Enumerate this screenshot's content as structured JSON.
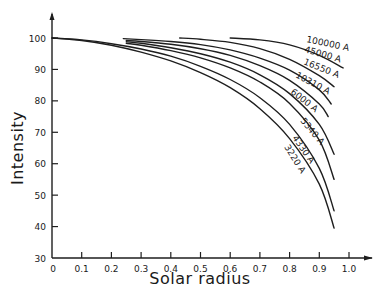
{
  "chart_data": {
    "type": "line",
    "title": "",
    "xlabel": "Solar radius",
    "ylabel": "Intensity",
    "xlim": [
      0,
      1.0
    ],
    "ylim": [
      30,
      100
    ],
    "grid": false,
    "legend": "inline labels at curve ends",
    "x_ticks": [
      "0",
      "0.1",
      "0.2",
      "0.3",
      "0.4",
      "0.5",
      "0.6",
      "0.7",
      "0.8",
      "0.9",
      "1.0"
    ],
    "y_ticks": [
      "30",
      "40",
      "50",
      "60",
      "70",
      "80",
      "90",
      "100"
    ],
    "series": [
      {
        "name": "100000 A",
        "x": [
          0.6,
          0.7,
          0.8,
          0.9,
          0.98
        ],
        "y": [
          100,
          99.4,
          97.8,
          94.5,
          90.5
        ]
      },
      {
        "name": "45000 A",
        "x": [
          0.43,
          0.5,
          0.6,
          0.7,
          0.8,
          0.9,
          0.95
        ],
        "y": [
          100,
          99.6,
          98.6,
          96.6,
          93.2,
          88,
          84.5
        ]
      },
      {
        "name": "16550 A",
        "x": [
          0.24,
          0.3,
          0.4,
          0.5,
          0.6,
          0.7,
          0.8,
          0.9,
          0.94
        ],
        "y": [
          99.8,
          99.5,
          98.9,
          97.9,
          96.2,
          93.6,
          89.8,
          83.5,
          79
        ]
      },
      {
        "name": "10310 A",
        "x": [
          0.25,
          0.3,
          0.4,
          0.5,
          0.6,
          0.7,
          0.8,
          0.9,
          0.93
        ],
        "y": [
          99.2,
          98.9,
          98.0,
          96.6,
          94.5,
          91.2,
          86.5,
          79,
          75
        ]
      },
      {
        "name": "6000 A",
        "x": [
          0.25,
          0.3,
          0.4,
          0.5,
          0.6,
          0.7,
          0.8,
          0.9,
          0.95
        ],
        "y": [
          98.8,
          98.3,
          96.9,
          95.0,
          92.3,
          88.3,
          82.3,
          72.5,
          63
        ]
      },
      {
        "name": "5340 A",
        "x": [
          0.25,
          0.3,
          0.4,
          0.5,
          0.6,
          0.7,
          0.8,
          0.9,
          0.95
        ],
        "y": [
          98.3,
          97.7,
          96.0,
          93.7,
          90.5,
          86.0,
          79.2,
          67.5,
          55
        ]
      },
      {
        "name": "4330 A",
        "x": [
          0,
          0.1,
          0.2,
          0.3,
          0.4,
          0.5,
          0.6,
          0.7,
          0.8,
          0.9,
          0.95
        ],
        "y": [
          100,
          99.4,
          98.2,
          96.5,
          94.2,
          91.0,
          86.8,
          81.0,
          72.5,
          58.5,
          45
        ]
      },
      {
        "name": "3220 A",
        "x": [
          0,
          0.1,
          0.2,
          0.3,
          0.4,
          0.5,
          0.6,
          0.7,
          0.8,
          0.9,
          0.95
        ],
        "y": [
          100,
          99.2,
          97.7,
          95.5,
          92.7,
          89.0,
          84.2,
          77.5,
          68.0,
          53.5,
          39.5
        ]
      }
    ]
  }
}
